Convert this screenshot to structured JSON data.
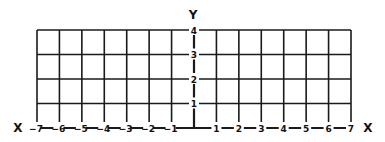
{
  "diagram": {
    "type": "coordinate-grid",
    "x_axis_label": "X",
    "x_axis_label_right": "X",
    "y_axis_label": "Y",
    "x_ticks": [
      -7,
      -6,
      -5,
      -4,
      -3,
      -2,
      -1,
      1,
      2,
      3,
      4,
      5,
      6,
      7
    ],
    "y_ticks": [
      1,
      2,
      3,
      4
    ],
    "x_range": [
      -7,
      7
    ],
    "y_range": [
      0,
      4
    ],
    "grid": true,
    "line_color": "#1a1a1a",
    "background": "#ffffff"
  }
}
